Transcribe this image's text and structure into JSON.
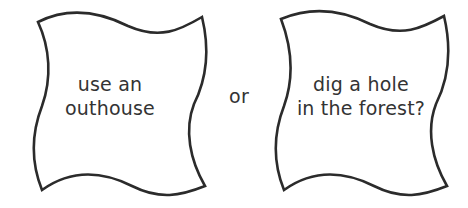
{
  "diagram": {
    "cards": [
      {
        "lines": [
          "use an",
          "outhouse"
        ]
      },
      {
        "lines": [
          "dig a hole",
          "in the forest?"
        ]
      }
    ],
    "connector": "or",
    "colors": {
      "stroke": "#2b2b2b",
      "text": "#333333",
      "background": "#ffffff"
    }
  }
}
